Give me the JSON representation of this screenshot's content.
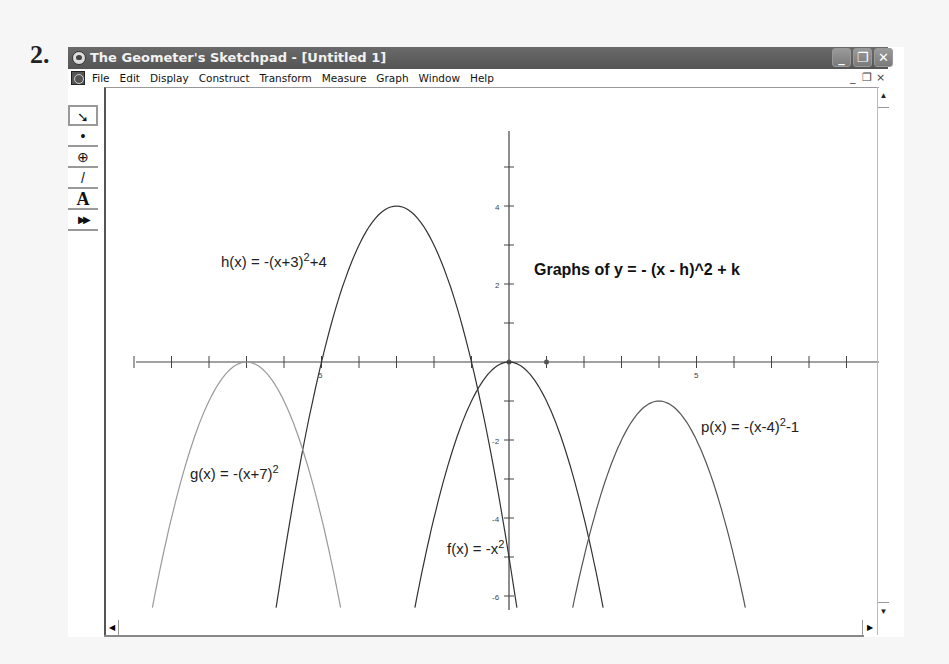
{
  "problem_number": "2.",
  "window": {
    "title": "The Geometer's Sketchpad - [Untitled 1]",
    "buttons": {
      "minimize": "_",
      "restore": "❐",
      "close": "✕"
    },
    "mdi_buttons": {
      "minimize": "_",
      "restore": "❐",
      "close": "×"
    }
  },
  "menubar": {
    "items": [
      "File",
      "Edit",
      "Display",
      "Construct",
      "Transform",
      "Measure",
      "Graph",
      "Window",
      "Help"
    ]
  },
  "toolbox": {
    "tools": [
      {
        "name": "selection-arrow-tool",
        "glyph": "➘"
      },
      {
        "name": "point-tool",
        "glyph": "•"
      },
      {
        "name": "compass-tool",
        "glyph": "⊕"
      },
      {
        "name": "straightedge-tool",
        "glyph": "/"
      },
      {
        "name": "text-tool",
        "glyph": "A"
      },
      {
        "name": "custom-tool",
        "glyph": "▶▶"
      }
    ]
  },
  "scrollbars": {
    "up": "▲",
    "down": "▼",
    "left": "◀",
    "right": "▶"
  },
  "sketch": {
    "heading": "Graphs of y = - (x - h)^2 + k",
    "labels": {
      "h": {
        "base": "h(x) = -(x+3)",
        "sup": "2",
        "tail": "+4"
      },
      "g": {
        "base": "g(x) = -(x+7)",
        "sup": "2",
        "tail": ""
      },
      "f": {
        "base": "f(x) = -x",
        "sup": "2",
        "tail": ""
      },
      "p": {
        "base": "p(x) = -(x-4)",
        "sup": "2",
        "tail": "-1"
      }
    },
    "x_tick_labels": {
      "neg5": "5",
      "pos5": "5"
    },
    "y_tick_labels": {
      "4": "4",
      "2": "2",
      "-2": "-2",
      "-4": "-4",
      "-6": "-6"
    }
  },
  "chart_data": {
    "type": "line",
    "title": "Graphs of y = - (x - h)^2 + k",
    "xlabel": "",
    "ylabel": "",
    "xlim": [
      -10,
      10
    ],
    "ylim": [
      -6.3,
      6
    ],
    "grid": false,
    "series": [
      {
        "name": "h(x) = -(x+3)^2+4",
        "h": -3,
        "k": 4,
        "vertex": [
          -3,
          4
        ],
        "color": "#333333"
      },
      {
        "name": "g(x) = -(x+7)^2",
        "h": -7,
        "k": 0,
        "vertex": [
          -7,
          0
        ],
        "color": "#9a9a9a"
      },
      {
        "name": "f(x) = -x^2",
        "h": 0,
        "k": 0,
        "vertex": [
          0,
          0
        ],
        "color": "#333333"
      },
      {
        "name": "p(x) = -(x-4)^2-1",
        "h": 4,
        "k": -1,
        "vertex": [
          4,
          -1
        ],
        "color": "#555555"
      }
    ],
    "x_ticks": [
      -10,
      -9,
      -8,
      -7,
      -6,
      -5,
      -4,
      -3,
      -2,
      -1,
      0,
      1,
      2,
      3,
      4,
      5,
      6,
      7,
      8,
      9
    ],
    "y_ticks": [
      -6,
      -5,
      -4,
      -3,
      -2,
      -1,
      0,
      1,
      2,
      3,
      4,
      5
    ]
  }
}
